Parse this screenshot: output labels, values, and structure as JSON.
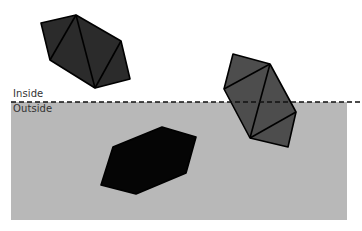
{
  "labels": {
    "inside": "Inside",
    "outside": "Outside"
  },
  "colors": {
    "background": "#ffffff",
    "outside_region": "#b8b8b8",
    "boundary_line": "#111111",
    "edge": "#000000",
    "polygon_inside": "#2b2b2b",
    "polygon_crossing": "#4d4d4d",
    "polygon_outside": "#050505"
  },
  "region": {
    "x": 11,
    "y": 102,
    "width": 336,
    "height": 118
  },
  "boundary": {
    "x1": 11,
    "x2": 362,
    "y": 102,
    "dash": "5,3"
  },
  "polygons": [
    {
      "name": "inside-polygon",
      "points": "41,23 76,15 121,41 130,79 95,88 50,60",
      "diagonals": [
        [
          76,
          15,
          50,
          60
        ],
        [
          76,
          15,
          95,
          88
        ],
        [
          95,
          88,
          121,
          41
        ]
      ],
      "color_key": "polygon_inside"
    },
    {
      "name": "crossing-polygon",
      "points": "233,54 270,64 296,112 288,147 250,138 224,89",
      "diagonals": [
        [
          270,
          64,
          224,
          89
        ],
        [
          270,
          64,
          250,
          138
        ],
        [
          250,
          138,
          296,
          112
        ]
      ],
      "color_key": "polygon_crossing"
    },
    {
      "name": "outside-polygon",
      "points": "113,147 162,127 196,137 186,173 136,194 101,185",
      "diagonals": [],
      "color_key": "polygon_outside"
    }
  ]
}
